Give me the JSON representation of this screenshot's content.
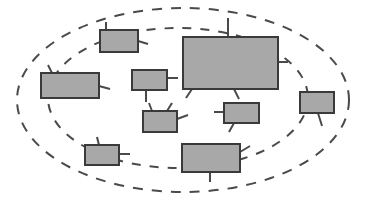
{
  "diagram": {
    "title": "",
    "background_color": "#ffffff",
    "canvas": {
      "width": 366,
      "height": 200
    },
    "style": {
      "node_fill": "#a8a8a8",
      "node_stroke": "#3a3a3a",
      "node_stroke_width": 2,
      "boundary_stroke": "#4a4a4a",
      "boundary_stroke_width": 2,
      "boundary_dash": "9 8",
      "connector_stroke": "#4a4a4a",
      "connector_stroke_width": 2
    },
    "boundaries": [
      {
        "name": "outer-boundary-ellipse",
        "shape": "ellipse",
        "cx": 183,
        "cy": 100,
        "rx": 166,
        "ry": 92,
        "dash": "10 9",
        "label": ""
      },
      {
        "name": "inner-boundary-ellipse",
        "shape": "ellipse",
        "cx": 178,
        "cy": 98,
        "rx": 130,
        "ry": 70,
        "dash": "9 9",
        "label": ""
      }
    ],
    "nodes": [
      {
        "id": "node-top-left",
        "label": "",
        "x": 100,
        "y": 30,
        "w": 38,
        "h": 22
      },
      {
        "id": "node-large-center",
        "label": "",
        "x": 183,
        "y": 37,
        "w": 95,
        "h": 52
      },
      {
        "id": "node-left",
        "label": "",
        "x": 41,
        "y": 73,
        "w": 58,
        "h": 25
      },
      {
        "id": "node-mid-left",
        "label": "",
        "x": 132,
        "y": 70,
        "w": 35,
        "h": 20
      },
      {
        "id": "node-far-right",
        "label": "",
        "x": 300,
        "y": 92,
        "w": 34,
        "h": 21
      },
      {
        "id": "node-right-mid",
        "label": "",
        "x": 224,
        "y": 103,
        "w": 35,
        "h": 20
      },
      {
        "id": "node-center",
        "label": "",
        "x": 143,
        "y": 111,
        "w": 34,
        "h": 21
      },
      {
        "id": "node-bottom-left",
        "label": "",
        "x": 85,
        "y": 145,
        "w": 34,
        "h": 20
      },
      {
        "id": "node-bottom-center",
        "label": "",
        "x": 182,
        "y": 144,
        "w": 58,
        "h": 28
      }
    ],
    "connectors": [
      {
        "name": "connector-top-left-up",
        "x1": 106,
        "y1": 30,
        "x2": 106,
        "y2": 22
      },
      {
        "name": "connector-top-left-right",
        "x1": 138,
        "y1": 41,
        "x2": 148,
        "y2": 44
      },
      {
        "name": "connector-large-top",
        "x1": 228,
        "y1": 37,
        "x2": 228,
        "y2": 18
      },
      {
        "name": "connector-large-bottom-left",
        "x1": 192,
        "y1": 89,
        "x2": 186,
        "y2": 98
      },
      {
        "name": "connector-large-bottom-mid",
        "x1": 234,
        "y1": 89,
        "x2": 239,
        "y2": 99
      },
      {
        "name": "connector-large-right",
        "x1": 278,
        "y1": 62,
        "x2": 288,
        "y2": 62
      },
      {
        "name": "connector-left-right",
        "x1": 99,
        "y1": 86,
        "x2": 110,
        "y2": 89
      },
      {
        "name": "connector-left-up",
        "x1": 52,
        "y1": 73,
        "x2": 48,
        "y2": 65
      },
      {
        "name": "connector-mid-left-right",
        "x1": 167,
        "y1": 78,
        "x2": 178,
        "y2": 78
      },
      {
        "name": "connector-mid-left-down",
        "x1": 146,
        "y1": 90,
        "x2": 146,
        "y2": 102
      },
      {
        "name": "connector-center-up-a",
        "x1": 152,
        "y1": 111,
        "x2": 149,
        "y2": 103
      },
      {
        "name": "connector-center-up-b",
        "x1": 167,
        "y1": 111,
        "x2": 172,
        "y2": 103
      },
      {
        "name": "connector-center-right",
        "x1": 177,
        "y1": 119,
        "x2": 188,
        "y2": 115
      },
      {
        "name": "connector-right-mid-left",
        "x1": 224,
        "y1": 112,
        "x2": 214,
        "y2": 112
      },
      {
        "name": "connector-right-mid-down",
        "x1": 234,
        "y1": 123,
        "x2": 229,
        "y2": 132
      },
      {
        "name": "connector-far-right-down",
        "x1": 318,
        "y1": 113,
        "x2": 322,
        "y2": 126
      },
      {
        "name": "connector-bottom-left-right",
        "x1": 119,
        "y1": 154,
        "x2": 130,
        "y2": 154
      },
      {
        "name": "connector-bottom-left-up",
        "x1": 99,
        "y1": 145,
        "x2": 97,
        "y2": 137
      },
      {
        "name": "connector-bottom-center-down",
        "x1": 210,
        "y1": 172,
        "x2": 210,
        "y2": 182
      },
      {
        "name": "connector-bottom-center-right",
        "x1": 240,
        "y1": 152,
        "x2": 250,
        "y2": 146
      }
    ]
  }
}
